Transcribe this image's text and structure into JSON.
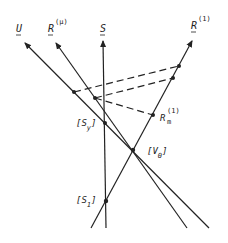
{
  "diagram": {
    "vectors": [
      {
        "id": "U",
        "label": "U",
        "superscript": ""
      },
      {
        "id": "R_mu",
        "label": "R",
        "superscript": "(μ)"
      },
      {
        "id": "S",
        "label": "S",
        "superscript": ""
      },
      {
        "id": "R_1",
        "label": "R",
        "superscript": "(1)"
      }
    ],
    "points": [
      {
        "id": "S_y",
        "label": "[S",
        "subscript": "y",
        "close": "]"
      },
      {
        "id": "V_0",
        "label": "[V",
        "subscript": "0",
        "close": "]"
      },
      {
        "id": "S_1",
        "label": "[S",
        "subscript": "1",
        "close": "]"
      },
      {
        "id": "R_m",
        "label": "R",
        "subscript": "m",
        "superscript": "(1)"
      }
    ],
    "line_color": "#222222",
    "background": "#ffffff"
  }
}
